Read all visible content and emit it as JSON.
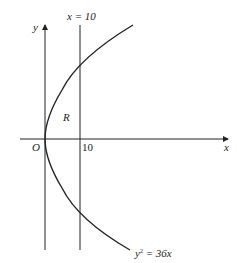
{
  "labels": {
    "y_axis": "y",
    "x_axis": "x",
    "origin": "O",
    "tick_10": "10",
    "line_label": "x = 10",
    "region": "R",
    "curve_label_y": "y",
    "curve_label_exp": "2",
    "curve_label_rest": " = 36x"
  },
  "colors": {
    "stroke": "#222222",
    "background": "#ffffff"
  }
}
